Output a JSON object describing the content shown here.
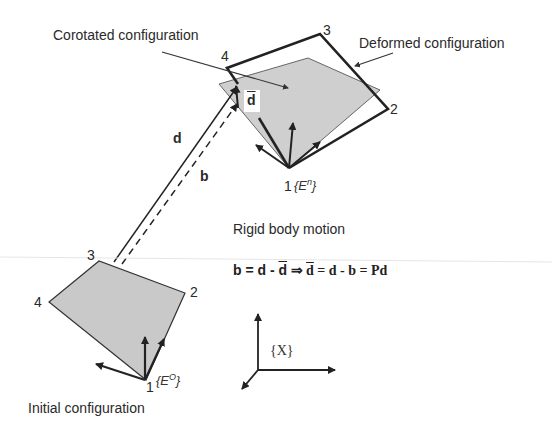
{
  "labels": {
    "corotated": "Corotated configuration",
    "deformed": "Deformed configuration",
    "rigid_motion": "Rigid body motion",
    "initial": "Initial configuration"
  },
  "vectors": {
    "d": "d",
    "b": "b",
    "d_bar": "d"
  },
  "equation": {
    "part1": "b = d - ",
    "part1_bar": "d",
    "arrow": " ⇒ ",
    "part2_bar": "d",
    "part2": " = d - b = Pd"
  },
  "initial_nodes": {
    "n1": "1",
    "n2": "2",
    "n3": "3",
    "n4": "4"
  },
  "deformed_nodes": {
    "n1": "1",
    "n2": "2",
    "n3": "3",
    "n4": "4"
  },
  "frames": {
    "initial": "{E",
    "initial_sup": "O",
    "initial_close": "}",
    "deformed": "{E",
    "deformed_sup": "n",
    "deformed_close": "}",
    "global": "{X}"
  },
  "colors": {
    "fill_gray": "#c8c8c8",
    "line_dark": "#2a2a2a",
    "corotated_line": "#666666"
  }
}
